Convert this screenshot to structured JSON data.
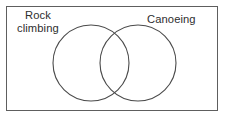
{
  "figure": {
    "kind": "venn-diagram",
    "background_color": "#ffffff",
    "universe": {
      "label": "",
      "border_color": "#5e5e5e"
    },
    "sets": [
      {
        "id": "rock-climbing",
        "label": "Rock\nclimbing",
        "label_line_1": "Rock",
        "label_line_2": "climbing",
        "stroke_color": "#4a4a4a",
        "fill": "none",
        "center_x": 91,
        "center_y": 63,
        "radius": 38
      },
      {
        "id": "canoeing",
        "label": "Canoeing",
        "stroke_color": "#4a4a4a",
        "fill": "none",
        "center_x": 138,
        "center_y": 63,
        "radius": 38
      }
    ],
    "text_color": "#2e2e2e"
  }
}
